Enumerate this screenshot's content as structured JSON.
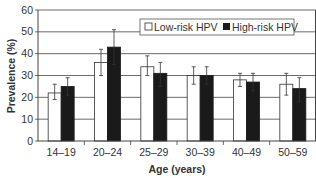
{
  "chart_data": {
    "type": "bar",
    "title": "",
    "xlabel": "Age (years)",
    "ylabel": "Prevalence (%)",
    "ylim": [
      0,
      60
    ],
    "yticks": [
      0,
      10,
      20,
      30,
      40,
      50,
      60
    ],
    "grid": true,
    "legend_position": "top-right inside",
    "categories": [
      "14–19",
      "20–24",
      "25–29",
      "30–39",
      "40–49",
      "50–59"
    ],
    "series": [
      {
        "name": "Low-risk HPV",
        "color": "#ffffff",
        "values": [
          22,
          36,
          34,
          30,
          28,
          26
        ],
        "error_low": [
          19,
          30,
          30,
          26,
          25,
          21
        ],
        "error_high": [
          26,
          42,
          39,
          34,
          31,
          31
        ]
      },
      {
        "name": "High-risk HPV",
        "color": "#1a1a1a",
        "values": [
          25,
          43,
          31,
          30,
          27,
          24
        ],
        "error_low": [
          21,
          35,
          25,
          26,
          23,
          18
        ],
        "error_high": [
          29,
          51,
          36,
          34,
          31,
          29
        ]
      }
    ]
  },
  "legend": {
    "items": [
      {
        "label": "Low-risk HPV",
        "color": "#ffffff"
      },
      {
        "label": "High-risk HPV",
        "color": "#1a1a1a"
      }
    ]
  },
  "axes": {
    "x_title": "Age (years)",
    "y_title": "Prevalence (%)"
  }
}
